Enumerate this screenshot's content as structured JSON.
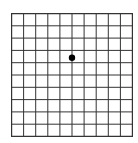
{
  "diagram": {
    "type": "amsler-grid",
    "columns": 10,
    "rows": 10,
    "line_color": "#333333",
    "background_color": "#ffffff",
    "fixation_dot": {
      "color": "#000000",
      "column_line": 5,
      "row_position": 3.6
    }
  }
}
